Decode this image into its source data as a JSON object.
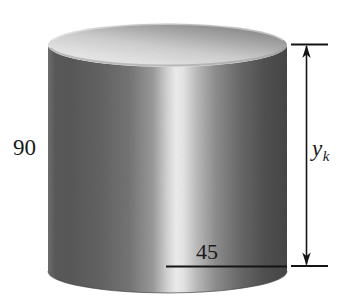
{
  "figure": {
    "type": "solid-of-revolution-cylinder-diagram",
    "shape": {
      "name": "cylinder",
      "surface_finish": "metallic-gradient-shading",
      "top_face": "ellipse",
      "bottom_face": "ellipse"
    },
    "labels": {
      "height_value": "90",
      "radius_value": "45",
      "variable_symbol": "y",
      "variable_subscript": "k"
    },
    "annotations": [
      {
        "id": "height-label",
        "text": "90",
        "role": "cylinder-height-dimension",
        "position": "left-of-cylinder"
      },
      {
        "id": "radius-label",
        "text": "45",
        "role": "cylinder-radius-dimension",
        "position": "above-bottom-radius-line"
      },
      {
        "id": "yk-label",
        "text": "y_k",
        "role": "slice-height-variable",
        "position": "right-of-dimension-arrow"
      }
    ],
    "dimension_arrow": {
      "orientation": "vertical",
      "style": "double-headed",
      "top_tick": true,
      "bottom_tick": true,
      "measures": "y_k"
    },
    "radius_line": {
      "orientation": "horizontal",
      "from": "cylinder-axis-center",
      "to": "cylinder-right-edge"
    },
    "colors": {
      "background": "#ffffff",
      "stroke": "#1a1a1a",
      "body_shadow_left": "#555555",
      "body_highlight": "#ececec",
      "body_shadow_right": "#474747",
      "top_face_light": "#e2e2e2",
      "top_face_dark": "#8a8a8a",
      "bottom_rim_dark": "#505050"
    }
  }
}
